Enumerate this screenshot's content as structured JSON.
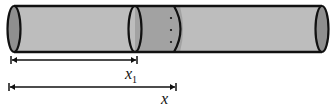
{
  "diagram": {
    "type": "cylinder-rod-with-section",
    "colors": {
      "rod_fill": "#bdbdbd",
      "slice_fill": "#a2a2a2",
      "end_cap_fill": "#8f8f8f",
      "outline": "#111111",
      "background": "#ffffff"
    },
    "labels": {
      "x1_main": "x",
      "x1_sub": "1",
      "x_main": "x"
    },
    "dimensions": [
      {
        "name": "x1",
        "from": "left end",
        "to": "start of shaded slice"
      },
      {
        "name": "x",
        "from": "left end",
        "to": "within shaded slice"
      }
    ]
  }
}
